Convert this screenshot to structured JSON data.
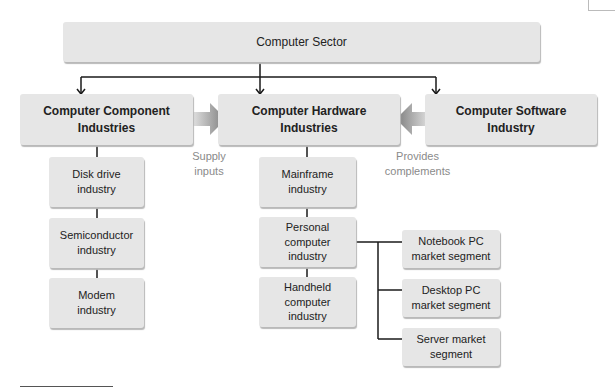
{
  "diagram": {
    "root": {
      "label": "Computer Sector"
    },
    "level1": [
      {
        "label": "Computer Component Industries"
      },
      {
        "label": "Computer Hardware Industries"
      },
      {
        "label": "Computer Software Industry"
      }
    ],
    "flows": [
      {
        "label": "Supply inputs",
        "from": "Computer Component Industries",
        "to": "Computer Hardware Industries"
      },
      {
        "label": "Provides complements",
        "from": "Computer Software Industry",
        "to": "Computer Hardware Industries"
      }
    ],
    "component_children": [
      {
        "label": "Disk drive industry"
      },
      {
        "label": "Semiconductor industry"
      },
      {
        "label": "Modem industry"
      }
    ],
    "hardware_children": [
      {
        "label": "Mainframe industry"
      },
      {
        "label": "Personal computer industry"
      },
      {
        "label": "Handheld computer industry"
      }
    ],
    "pc_segments": [
      {
        "label": "Notebook PC market segment"
      },
      {
        "label": "Desktop PC market segment"
      },
      {
        "label": "Server market segment"
      }
    ]
  },
  "colors": {
    "box_fill": "#e6e6e6",
    "arrow_fill": "#8c8c8c",
    "flow_label": "#8a8a8a",
    "line": "#1a1a1a"
  }
}
